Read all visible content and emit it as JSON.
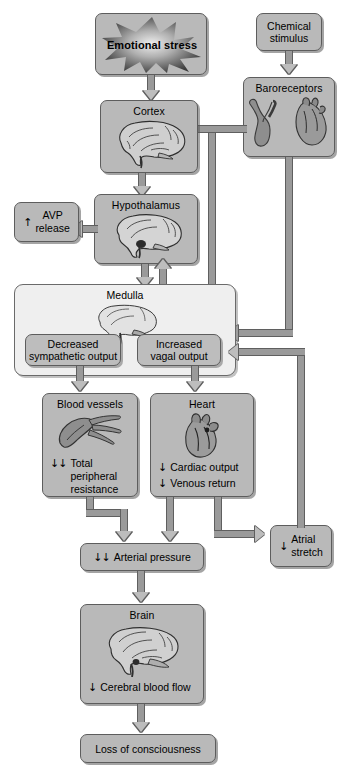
{
  "diagram": {
    "colors": {
      "box_fill": "#b9b9b9",
      "panel_fill": "#efefef",
      "sub_fill": "#bdbdbd",
      "connector_fill": "#9a9a9a",
      "outline": "#5d5d5d"
    }
  },
  "nodes": {
    "emotional_stress": {
      "label": "Emotional stress",
      "icon": "starburst-icon"
    },
    "chemical_stimulus": {
      "label": "Chemical\nstimulus",
      "line1": "Chemical",
      "line2": "stimulus"
    },
    "baroreceptors": {
      "title": "Baroreceptors",
      "icon": "carotid-sinus-and-heart-icon"
    },
    "cortex": {
      "title": "Cortex",
      "icon": "brain-sagittal-icon"
    },
    "hypothalamus": {
      "title": "Hypothalamus",
      "icon": "brain-hypothalamus-icon"
    },
    "avp_release": {
      "arrow": "↑",
      "line1": "AVP",
      "line2": "release"
    },
    "medulla": {
      "title": "Medulla",
      "icon": "brain-medulla-icon"
    },
    "decreased_sympathetic": {
      "line1": "Decreased",
      "line2": "sympathetic output"
    },
    "increased_vagal": {
      "line1": "Increased",
      "line2": "vagal output"
    },
    "blood_vessels": {
      "title": "Blood vessels",
      "icon": "blood-vessel-icon",
      "metric": {
        "arrow": "↓↓",
        "line1": "Total peripheral",
        "line2": "resistance"
      }
    },
    "heart": {
      "title": "Heart",
      "icon": "heart-icon",
      "metrics": [
        {
          "arrow": "↓",
          "label": "Cardiac output"
        },
        {
          "arrow": "↓",
          "label": "Venous return"
        }
      ]
    },
    "arterial_pressure": {
      "arrow": "↓↓",
      "label": "Arterial pressure"
    },
    "atrial_stretch": {
      "arrow": "↓",
      "line1": "Atrial",
      "line2": "stretch"
    },
    "brain": {
      "title": "Brain",
      "icon": "brain-sagittal-icon",
      "metric": {
        "arrow": "↓",
        "label": "Cerebral blood flow"
      }
    },
    "loss_of_consciousness": {
      "label": "Loss of consciousness"
    }
  }
}
